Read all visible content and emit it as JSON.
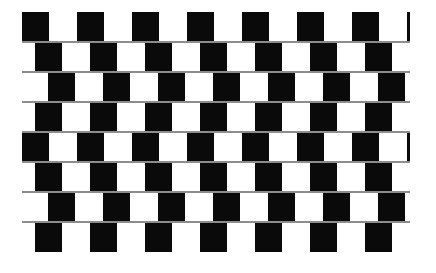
{
  "image": {
    "title": "Cafe Wall Illusion",
    "kind": "geometric-optical-illusion",
    "width": 436,
    "height": 273,
    "background_color": "#ffffff"
  },
  "pattern": {
    "name": "cafe-wall",
    "tile_color": "#0a0a0a",
    "gap_color": "#ffffff",
    "mortar_color": "#8d8d8d",
    "mortar_thickness": 2,
    "row_height": 30,
    "tile_width": 27,
    "tile_period": 55,
    "rows": 8,
    "tiles_per_row": 7,
    "left": 22,
    "top": 12,
    "pattern_width": 388,
    "pattern_height": 243,
    "row_offsets": [
      0,
      13,
      26,
      13,
      0,
      13,
      26,
      13
    ],
    "row_labels": [
      "row-1",
      "row-2",
      "row-3",
      "row-4",
      "row-5",
      "row-6",
      "row-7",
      "row-8"
    ]
  }
}
